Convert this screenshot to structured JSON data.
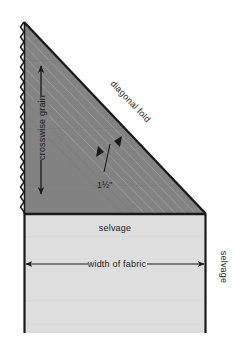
{
  "figure": {
    "type": "sewing-layout-diagram",
    "background_color": "#ffffff"
  },
  "colors": {
    "triangle_fill": "#838383",
    "fabric_fill": "#dedede",
    "outline": "#1a1a1a",
    "text": "#1a1a1a",
    "guide_line": "#9c9c9c"
  },
  "labels": {
    "crosswise_grain": "crosswise grain",
    "diagonal_fold": "diagonal fold",
    "strip_width": "1½\"",
    "selvage_top": "selvage",
    "width_of_fabric": "width of fabric",
    "selvage_right": "selvage"
  },
  "shapes": {
    "triangle": {
      "name": "folded-bias-triangle",
      "points": "24,22 206,214 24,214",
      "fill": "#838383"
    },
    "fabric_rect": {
      "name": "fabric-body",
      "x": 24,
      "y": 214,
      "width": 182,
      "height": 119,
      "fill": "#dedede"
    }
  },
  "measurements": {
    "strip_width_value": "1½",
    "strip_width_unit": "\""
  },
  "icons": {
    "arrow_up": "arrow-up-icon",
    "arrow_down": "arrow-down-icon",
    "arrow_left": "arrow-left-icon",
    "arrow_right": "arrow-right-icon",
    "arrowhead_pair": "double-arrowhead-icon"
  }
}
